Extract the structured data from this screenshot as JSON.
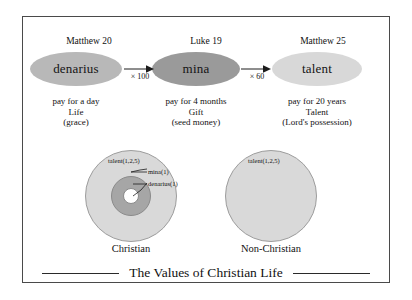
{
  "figure": {
    "caption": "The Values of Christian Life"
  },
  "flow": {
    "steps": [
      {
        "reference": "Matthew 20",
        "coin": "denarius",
        "description_line1": "pay for a day",
        "description_line2": "Life",
        "description_line3": "(grace)"
      },
      {
        "reference": "Luke 19",
        "coin": "mina",
        "description_line1": "pay for 4 months",
        "description_line2": "Gift",
        "description_line3": "(seed money)"
      },
      {
        "reference": "Matthew 25",
        "coin": "talent",
        "description_line1": "pay for 20 years",
        "description_line2": "Talent",
        "description_line3": "(Lord's possession)"
      }
    ],
    "multipliers": [
      "× 100",
      "× 60"
    ]
  },
  "venn": {
    "left": {
      "caption": "Christian",
      "outer_label": "talent(1,2,5)",
      "mid_label": "mina(1)",
      "inner_label": "denarius(1)"
    },
    "right": {
      "caption": "Non-Christian",
      "outer_label": "talent(1,2,5)"
    }
  },
  "colors": {
    "denarius_fill": "#b8b8b8",
    "mina_fill": "#9a9a9a",
    "talent_fill": "#d8d8d8",
    "circle_outer_fill": "#d9d9d9",
    "circle_mid_fill": "#a6a6a6",
    "circle_inner_fill": "#ffffff",
    "frame_border": "#4a4a4a"
  }
}
